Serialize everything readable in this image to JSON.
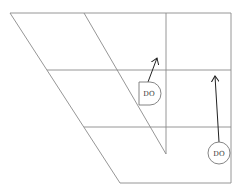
{
  "diagram": {
    "type": "skewed-grid-with-symbols",
    "symbols": [
      {
        "shape": "d-gate",
        "label": "DO",
        "mirrored": true
      },
      {
        "shape": "circle",
        "label": "DO"
      }
    ],
    "arrows": [
      {
        "from": "d-gate",
        "direction": "up-right"
      },
      {
        "from": "circle",
        "direction": "up"
      }
    ],
    "colors": {
      "lines": "#8a8a8a",
      "arrows": "#222222",
      "background": "#ffffff"
    }
  }
}
